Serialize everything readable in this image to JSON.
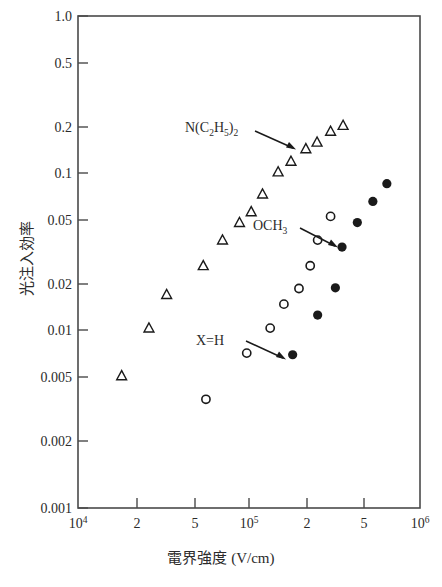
{
  "chart_data": {
    "type": "scatter",
    "title": "",
    "xlabel": "電界強度 (V/cm)",
    "ylabel": "光注入効率",
    "xscale": "log",
    "yscale": "log",
    "xlim": [
      10000,
      1000000
    ],
    "ylim": [
      0.001,
      1.0
    ],
    "grid": false,
    "legend": "none",
    "x_tick_values": [
      10000,
      20000,
      50000,
      100000,
      200000,
      500000,
      1000000
    ],
    "x_tick_labels": [
      "10^4",
      "2",
      "5",
      "10^5",
      "2",
      "5",
      "10^6"
    ],
    "y_tick_values": [
      1.0,
      0.5,
      0.2,
      0.1,
      0.05,
      0.02,
      0.01,
      0.005,
      0.002,
      0.001
    ],
    "y_tick_labels": [
      "1.0",
      "0.5",
      "0.2",
      "0.1",
      "0.05",
      "0.02",
      "0.01",
      "0.005",
      "0.002",
      "0.001"
    ],
    "series": [
      {
        "name": "N(C2H5)2",
        "marker": "open-triangle",
        "color": "#1a1a1a",
        "points": [
          {
            "x": 18000,
            "y": 0.0064
          },
          {
            "x": 33000,
            "y": 0.02
          },
          {
            "x": 26000,
            "y": 0.0125
          },
          {
            "x": 54000,
            "y": 0.03
          },
          {
            "x": 70000,
            "y": 0.043
          },
          {
            "x": 88000,
            "y": 0.055
          },
          {
            "x": 103000,
            "y": 0.064
          },
          {
            "x": 120000,
            "y": 0.082
          },
          {
            "x": 148000,
            "y": 0.112
          },
          {
            "x": 176000,
            "y": 0.13
          },
          {
            "x": 215000,
            "y": 0.155
          },
          {
            "x": 250000,
            "y": 0.17
          },
          {
            "x": 300000,
            "y": 0.198
          },
          {
            "x": 355000,
            "y": 0.215
          }
        ]
      },
      {
        "name": "OCH3",
        "marker": "open-circle",
        "color": "#1a1a1a",
        "points": [
          {
            "x": 56000,
            "y": 0.0046
          },
          {
            "x": 97000,
            "y": 0.0088
          },
          {
            "x": 133000,
            "y": 0.0125
          },
          {
            "x": 160000,
            "y": 0.0175
          },
          {
            "x": 196000,
            "y": 0.0218
          },
          {
            "x": 228000,
            "y": 0.03
          },
          {
            "x": 252000,
            "y": 0.043
          },
          {
            "x": 300000,
            "y": 0.06
          }
        ]
      },
      {
        "name": "X=H",
        "marker": "filled-circle",
        "color": "#1a1a1a",
        "points": [
          {
            "x": 180000,
            "y": 0.0086
          },
          {
            "x": 252000,
            "y": 0.015
          },
          {
            "x": 320000,
            "y": 0.022
          },
          {
            "x": 350000,
            "y": 0.039
          },
          {
            "x": 430000,
            "y": 0.055
          },
          {
            "x": 530000,
            "y": 0.074
          },
          {
            "x": 640000,
            "y": 0.095
          }
        ]
      }
    ],
    "annotations": [
      {
        "label": "N(C2H5)2",
        "text_x": 185,
        "text_y": 127,
        "arrow_from_x": 252,
        "arrow_from_y": 131,
        "arrow_to_x": 292,
        "arrow_to_y": 147
      },
      {
        "label": "OCH3",
        "text_x": 253,
        "text_y": 225,
        "arrow_from_x": 298,
        "arrow_from_y": 227,
        "arrow_to_x": 334,
        "arrow_to_y": 246
      },
      {
        "label": "X=H",
        "text_x": 196,
        "text_y": 340,
        "arrow_from_x": 245,
        "arrow_from_y": 341,
        "arrow_to_x": 283,
        "arrow_to_y": 357
      }
    ]
  },
  "axes": {
    "y_title": "光注入効率",
    "x_title_main": "電界強度",
    "x_title_unit": "(V/cm)",
    "x_title_full": "電界強度 (V/cm)",
    "x_labels": {
      "t0_base": "10",
      "t0_exp": "4",
      "t1": "2",
      "t2": "5",
      "t3_base": "10",
      "t3_exp": "5",
      "t4": "2",
      "t5": "5",
      "t6_base": "10",
      "t6_exp": "6"
    },
    "y_labels": {
      "y0": "1.0",
      "y1": "0.5",
      "y2": "0.2",
      "y3": "0.1",
      "y4": "0.05",
      "y5": "0.02",
      "y6": "0.01",
      "y7": "0.005",
      "y8": "0.002",
      "y9": "0.001"
    }
  },
  "annotation_text": {
    "n_diethyl_a": "N(C",
    "n_diethyl_sub1": "2",
    "n_diethyl_b": "H",
    "n_diethyl_sub2": "5",
    "n_diethyl_c": ")",
    "n_diethyl_sub3": "2",
    "och3_a": "OCH",
    "och3_sub": "3",
    "xh": "X=H"
  }
}
